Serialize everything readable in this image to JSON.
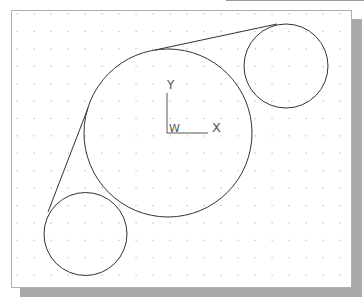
{
  "drawing": {
    "grid": {
      "start_x": 17,
      "start_y": 14,
      "spacing_x": 17,
      "spacing_y": 17.4,
      "cols": 20,
      "rows": 16,
      "dot_color": "#b8b8b8"
    },
    "circles": [
      {
        "name": "large-circle",
        "cx": 168,
        "cy": 133,
        "r": 84
      },
      {
        "name": "top-right-circle",
        "cx": 286,
        "cy": 66,
        "r": 42
      },
      {
        "name": "bottom-left-circle",
        "cx": 85.5,
        "cy": 234,
        "r": 41.5
      }
    ],
    "lines": [
      {
        "name": "top-tangent-line",
        "x1": 155,
        "y1": 50,
        "x2": 277,
        "y2": 24
      },
      {
        "name": "left-tangent-line",
        "x1": 88,
        "y1": 108,
        "x2": 48,
        "y2": 212
      }
    ],
    "stroke_color": "#333333",
    "ucs_icon": {
      "origin_x": 167,
      "origin_y": 133,
      "y_label": "Y",
      "x_label": "X",
      "w_label": "W",
      "color": "#555555"
    }
  }
}
